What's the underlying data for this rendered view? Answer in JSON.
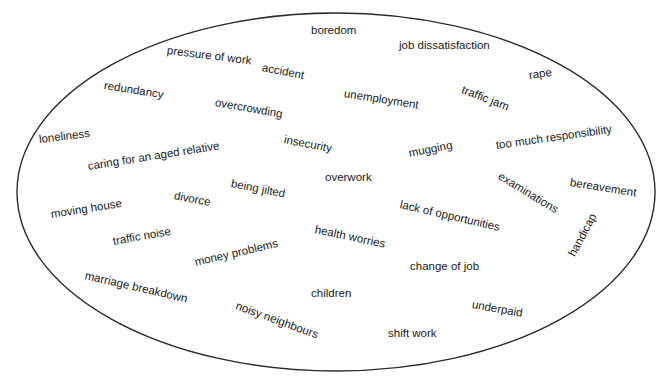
{
  "diagram": {
    "title": "",
    "shape": "ellipse",
    "stroke_color": "#2b2b2b",
    "fill_color": "#ffffff",
    "background_color": "#ffffff",
    "text_color": "#1a1a1a",
    "ellipse": {
      "cx": 336,
      "cy": 192,
      "rx": 319,
      "ry": 179,
      "stroke_width": 1.4
    },
    "labels": [
      {
        "text": "boredom",
        "x": 311,
        "y": 25,
        "rot": 0
      },
      {
        "text": "pressure of work",
        "x": 167,
        "y": 45,
        "rot": 7
      },
      {
        "text": "job dissatisfaction",
        "x": 399,
        "y": 40,
        "rot": 0
      },
      {
        "text": "accident",
        "x": 262,
        "y": 62,
        "rot": 11
      },
      {
        "text": "rape",
        "x": 529,
        "y": 70,
        "rot": -8
      },
      {
        "text": "redundancy",
        "x": 104,
        "y": 80,
        "rot": 9
      },
      {
        "text": "unemployment",
        "x": 344,
        "y": 88,
        "rot": 9
      },
      {
        "text": "traffic jam",
        "x": 462,
        "y": 84,
        "rot": 21
      },
      {
        "text": "overcrowding",
        "x": 215,
        "y": 97,
        "rot": 10
      },
      {
        "text": "loneliness",
        "x": 39,
        "y": 134,
        "rot": -7
      },
      {
        "text": "insecurity",
        "x": 284,
        "y": 134,
        "rot": 11
      },
      {
        "text": "too much responsibility",
        "x": 496,
        "y": 140,
        "rot": -8
      },
      {
        "text": "caring for an aged relative",
        "x": 88,
        "y": 161,
        "rot": -9
      },
      {
        "text": "mugging",
        "x": 409,
        "y": 148,
        "rot": -11
      },
      {
        "text": "bereavement",
        "x": 570,
        "y": 177,
        "rot": 9
      },
      {
        "text": "overwork",
        "x": 325,
        "y": 172,
        "rot": 0
      },
      {
        "text": "examinations",
        "x": 499,
        "y": 170,
        "rot": 31
      },
      {
        "text": "being jilted",
        "x": 231,
        "y": 178,
        "rot": 11
      },
      {
        "text": "divorce",
        "x": 174,
        "y": 190,
        "rot": 11
      },
      {
        "text": "lack of opportunities",
        "x": 400,
        "y": 199,
        "rot": 13
      },
      {
        "text": "moving house",
        "x": 51,
        "y": 209,
        "rot": -9
      },
      {
        "text": "traffic noise",
        "x": 113,
        "y": 236,
        "rot": -10
      },
      {
        "text": "health worries",
        "x": 315,
        "y": 224,
        "rot": 12
      },
      {
        "text": "handicap",
        "x": 572,
        "y": 250,
        "rot": -62
      },
      {
        "text": "money problems",
        "x": 195,
        "y": 257,
        "rot": -13
      },
      {
        "text": "change of job",
        "x": 410,
        "y": 261,
        "rot": 0
      },
      {
        "text": "marriage breakdown",
        "x": 85,
        "y": 270,
        "rot": 13
      },
      {
        "text": "children",
        "x": 311,
        "y": 288,
        "rot": 0
      },
      {
        "text": "underpaid",
        "x": 472,
        "y": 299,
        "rot": 10
      },
      {
        "text": "noisy neighbours",
        "x": 236,
        "y": 300,
        "rot": 20
      },
      {
        "text": "shift work",
        "x": 388,
        "y": 328,
        "rot": 0
      }
    ]
  }
}
